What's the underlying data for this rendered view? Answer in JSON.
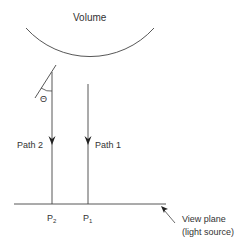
{
  "diagram": {
    "volume_label": "Volume",
    "angle_label": "Θ",
    "path2_label": "Path 2",
    "path1_label": "Path 1",
    "p2_label": "P",
    "p2_sub": "2",
    "p1_label": "P",
    "p1_sub": "1",
    "view_plane_label": "View plane",
    "light_source_label": "(light source)",
    "colors": {
      "stroke": "#333333",
      "background": "#ffffff"
    }
  }
}
